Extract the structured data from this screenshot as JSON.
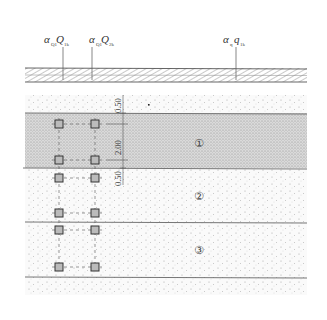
{
  "loads": [
    {
      "id": "load-q1",
      "alpha": "α",
      "alpha_sub": "Q1",
      "sym": "Q",
      "sym_sub": "1k",
      "x": 62
    },
    {
      "id": "load-q2",
      "alpha": "α",
      "alpha_sub": "Q1",
      "sym": "Q",
      "sym_sub": "2k",
      "x": 92
    },
    {
      "id": "load-q",
      "alpha": "α",
      "alpha_sub": "q",
      "sym": "q",
      "sym_sub": "1k",
      "x": 236
    }
  ],
  "dimensions": [
    "0.50",
    "2.00",
    "0.50"
  ],
  "layers": [
    {
      "label": "①",
      "shade": "dense"
    },
    {
      "label": "②",
      "shade": "sparse"
    },
    {
      "label": "③",
      "shade": "sparse"
    }
  ],
  "piles": {
    "columns_x": [
      59,
      95
    ],
    "rows_y": [
      124,
      160,
      178,
      213,
      230,
      267
    ]
  },
  "colors": {
    "line": "#555555",
    "slab_hatch": "#666666",
    "dense_soil": "#cfcfcf",
    "sparse_soil": "#f3f3f3",
    "pile": "#333333"
  }
}
